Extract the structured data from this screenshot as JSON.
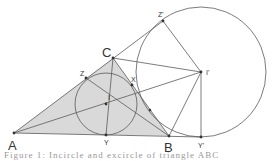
{
  "diagram": {
    "type": "geometry",
    "colors": {
      "line": "#5a5a5a",
      "fill": "#d9d9d9",
      "point": "#333333",
      "background": "#ffffff"
    },
    "points": [
      {
        "id": "A",
        "label": "A",
        "x": 14,
        "y": 133,
        "label_x": 8,
        "label_y": 150,
        "size": 13
      },
      {
        "id": "B",
        "label": "B",
        "x": 169,
        "y": 136,
        "label_x": 164,
        "label_y": 152,
        "size": 13
      },
      {
        "id": "C",
        "label": "C",
        "x": 113,
        "y": 58,
        "label_x": 102,
        "label_y": 57,
        "size": 13
      },
      {
        "id": "I",
        "label": "I",
        "x": 106,
        "y": 104,
        "label_x": 108,
        "label_y": 100,
        "size": 7
      },
      {
        "id": "Z",
        "label": "Z",
        "x": 86,
        "y": 78,
        "label_x": 80,
        "label_y": 76,
        "size": 7
      },
      {
        "id": "X",
        "label": "X",
        "x": 132,
        "y": 85,
        "label_x": 131,
        "label_y": 82,
        "size": 7
      },
      {
        "id": "Y",
        "label": "Y",
        "x": 106,
        "y": 135,
        "label_x": 104,
        "label_y": 145,
        "size": 7
      },
      {
        "id": "Zp",
        "label": "Z'",
        "x": 163,
        "y": 21,
        "label_x": 158,
        "label_y": 17,
        "size": 7
      },
      {
        "id": "Ip",
        "label": "I'",
        "x": 201,
        "y": 72,
        "label_x": 206,
        "label_y": 75,
        "size": 7
      },
      {
        "id": "Yp",
        "label": "Y'",
        "x": 201,
        "y": 137,
        "label_x": 198,
        "label_y": 148,
        "size": 7
      },
      {
        "id": "T",
        "label": "",
        "x": 150,
        "y": 110,
        "label_x": 0,
        "label_y": 0,
        "size": 0
      }
    ],
    "circles": [
      {
        "name": "incircle",
        "cx": 106,
        "cy": 104,
        "r": 31
      },
      {
        "name": "excircle",
        "cx": 201,
        "cy": 72,
        "r": 65
      }
    ],
    "caption": "Figure 1: Incircle and excircle of triangle ABC"
  }
}
